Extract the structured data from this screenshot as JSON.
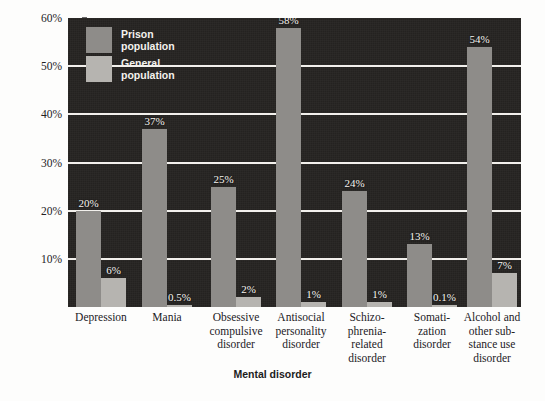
{
  "chart_data": {
    "type": "bar",
    "title": "",
    "xlabel": "Mental disorder",
    "ylabel": "Percentage with mental disorder",
    "ylim": [
      0,
      60
    ],
    "yticks": [
      "10%",
      "20%",
      "30%",
      "40%",
      "50%",
      "60%"
    ],
    "ytick_values": [
      10,
      20,
      30,
      40,
      50,
      60
    ],
    "grid": true,
    "legend_position": "top-left",
    "categories": [
      "Depression",
      "Mania",
      "Obsessive\ncompulsive\ndisorder",
      "Antisocial\npersonality\ndisorder",
      "Schizo-\nphrenia-\nrelated\ndisorder",
      "Somati-\nzation\ndisorder",
      "Alcohol and\nother sub-\nstance use\ndisorder"
    ],
    "series": [
      {
        "name": "Prison population",
        "color": "#8e8c89",
        "values": [
          20,
          37,
          25,
          58,
          24,
          13,
          54
        ],
        "labels": [
          "20%",
          "37%",
          "25%",
          "58%",
          "24%",
          "13%",
          "54%"
        ]
      },
      {
        "name": "General population",
        "color": "#b6b4b0",
        "values": [
          6,
          0.5,
          2,
          1,
          1,
          0.1,
          7
        ],
        "labels": [
          "6%",
          "0.5%",
          "2%",
          "1%",
          "1%",
          "0.1%",
          "7%"
        ]
      }
    ]
  },
  "legend": {
    "items": [
      {
        "label": "Prison\npopulation",
        "color": "#8e8c89"
      },
      {
        "label": "General\npopulation",
        "color": "#b6b4b0"
      }
    ]
  },
  "axes": {
    "y_title": "Percentage with mental disorder",
    "x_title": "Mental disorder"
  },
  "caption": {
    "clipped_text": ""
  },
  "colors": {
    "plot_background": "#262422",
    "gridline": "#f2f0ec",
    "prison_bar": "#8e8c89",
    "general_bar": "#b6b4b0",
    "page_background": "#fdfdfc",
    "label_text": "#f6f4f0",
    "axis_text": "#23211f"
  }
}
